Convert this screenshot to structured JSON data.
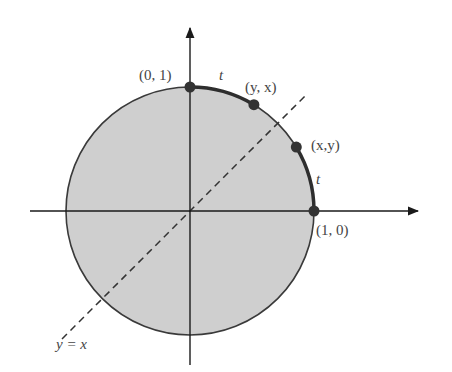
{
  "diagram": {
    "colors": {
      "disk_fill": "#cfcfcf",
      "circle_stroke": "#3a3a3a",
      "arc_stroke": "#2e2e2e",
      "axis_stroke": "#1a1a1a",
      "point_fill": "#333333",
      "dashed_line": "#333333",
      "label_color": "#444444"
    },
    "labels": {
      "top_point": "(0, 1)",
      "right_point": "(1, 0)",
      "point_xy": "(x,y)",
      "point_yx": "(y, x)",
      "arc_top": "t",
      "arc_right": "t",
      "line": "y = x"
    },
    "points": [
      {
        "name": "(0, 1)",
        "angle_deg": 90
      },
      {
        "name": "(y, x)",
        "angle_deg": 59
      },
      {
        "name": "(x,y)",
        "angle_deg": 31
      },
      {
        "name": "(1, 0)",
        "angle_deg": 0
      }
    ]
  }
}
